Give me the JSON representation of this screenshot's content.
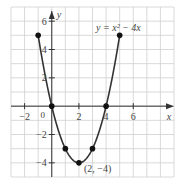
{
  "chart_data": {
    "type": "line",
    "title": "",
    "equation_label": "y = x² − 4x",
    "xlabel": "x",
    "ylabel": "y",
    "xlim": [
      -3,
      9
    ],
    "ylim": [
      -5,
      7
    ],
    "grid": true,
    "x_ticks": [
      -2,
      2,
      4,
      6
    ],
    "x_tick_labels": [
      "−2",
      "2",
      "4",
      "6"
    ],
    "y_ticks": [
      -4,
      -2,
      2,
      4,
      6
    ],
    "y_tick_labels": [
      "−4",
      "−2",
      "2",
      "4",
      "6"
    ],
    "origin_label": "0",
    "points": [
      {
        "x": -1,
        "y": 5
      },
      {
        "x": 0,
        "y": 0
      },
      {
        "x": 1,
        "y": -3
      },
      {
        "x": 2,
        "y": -4
      },
      {
        "x": 3,
        "y": -3
      },
      {
        "x": 4,
        "y": 0
      },
      {
        "x": 5,
        "y": 5
      }
    ],
    "curve_domain": [
      -1,
      5
    ],
    "annotations": [
      {
        "text": "(2, −4)",
        "x": 2,
        "y": -4
      }
    ],
    "colors": {
      "grid": "#cfcfcf",
      "axis": "#333333",
      "curve": "#333333",
      "point": "#111111"
    }
  }
}
